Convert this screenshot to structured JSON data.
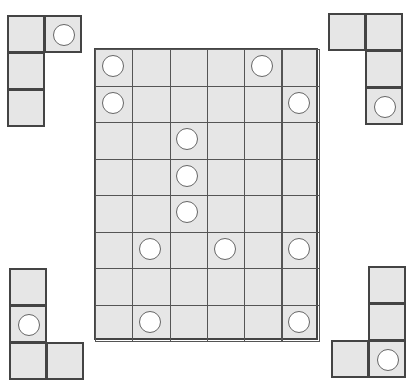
{
  "colors": {
    "cell_fill": "#e6e6e6",
    "border": "#444444",
    "circle_fill": "#ffffff"
  },
  "main_grid": {
    "x": 94,
    "y": 48,
    "cols": 6,
    "rows": 8,
    "cell_w": 37.3,
    "cell_h": 36.5,
    "circles": [
      [
        0,
        0
      ],
      [
        0,
        4
      ],
      [
        1,
        0
      ],
      [
        1,
        5
      ],
      [
        2,
        2
      ],
      [
        3,
        2
      ],
      [
        4,
        2
      ],
      [
        5,
        1
      ],
      [
        5,
        3
      ],
      [
        5,
        5
      ],
      [
        7,
        1
      ],
      [
        7,
        5
      ]
    ]
  },
  "pieces": [
    {
      "name": "piece-top-left",
      "x": 7,
      "y": 15,
      "cell": 37,
      "cells": [
        [
          0,
          0
        ],
        [
          0,
          1
        ],
        [
          1,
          0
        ],
        [
          2,
          0
        ]
      ],
      "circle": [
        0,
        1
      ]
    },
    {
      "name": "piece-top-right",
      "x": 328,
      "y": 13,
      "cell": 37,
      "cells": [
        [
          0,
          0
        ],
        [
          0,
          1
        ],
        [
          1,
          1
        ],
        [
          2,
          1
        ]
      ],
      "circle": [
        2,
        1
      ]
    },
    {
      "name": "piece-bottom-left",
      "x": 9,
      "y": 268,
      "cell": 37,
      "cells": [
        [
          0,
          0
        ],
        [
          1,
          0
        ],
        [
          2,
          0
        ],
        [
          2,
          1
        ]
      ],
      "circle": [
        1,
        0
      ]
    },
    {
      "name": "piece-bottom-right",
      "x": 331,
      "y": 266,
      "cell": 37,
      "cells": [
        [
          0,
          1
        ],
        [
          1,
          1
        ],
        [
          2,
          0
        ],
        [
          2,
          1
        ]
      ],
      "circle": [
        2,
        1
      ]
    }
  ]
}
